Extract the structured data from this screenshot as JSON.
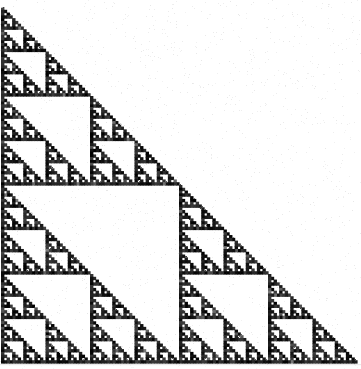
{
  "figure": {
    "title": "Sierpinski Triangle",
    "caption": "",
    "type": "fractal-diagram",
    "fractal_name": "sierpinski-gasket",
    "equivalent_construction": "pascals-triangle-modulo-2",
    "canvas": {
      "width": 361,
      "height": 369,
      "background_color": "#ffffff",
      "ink_color": "#0d0d0d"
    },
    "render": {
      "subdivision_rule": "divide-right-triangle-into-4-congruent-halves-keep-3",
      "removed_child": "lower-left",
      "orientation": "right-angle-at-bottom-right",
      "hypotenuse_from": "bottom-left",
      "hypotenuse_to": "top-right",
      "sub_triangle_right_angle_corner": "top-left",
      "recursion_depth": 8,
      "min_cell_px": 1.4,
      "grid_order": 128
    },
    "geometry": {
      "apex_top_right": [
        357,
        7
      ],
      "corner_bottom_right": [
        357,
        363
      ],
      "corner_bottom_left": [
        1,
        363
      ],
      "leg_length_px": 356,
      "hypotenuse_slope": -1.0
    },
    "texture": {
      "style": "scanned-halftone",
      "noise_amount": 0.13,
      "ink_min": 0,
      "ink_max": 58,
      "paper_min": 243,
      "paper_max": 255,
      "edge_speckle": 0.34,
      "bottom_smudge_rows": 4
    }
  },
  "chart_data": {
    "type": "fractal",
    "title": "Sierpinski Triangle",
    "xlabel": "",
    "ylabel": "",
    "iterations": 8,
    "self_similar_copies_per_step": 3,
    "scale_factor_per_step": 0.5,
    "hausdorff_dimension": 1.585,
    "filled_cell_fraction_per_level": [
      1,
      0.75,
      0.5625,
      0.4219,
      0.3164,
      0.2373,
      0.178,
      0.1335,
      0.1001
    ],
    "level_cell_counts": [
      1,
      3,
      9,
      27,
      81,
      243,
      729,
      2187,
      6561
    ],
    "level_cell_size_px": [
      356,
      178,
      89,
      44.5,
      22.25,
      11.13,
      5.56,
      2.78,
      1.39
    ],
    "legend": [],
    "annotations": []
  }
}
